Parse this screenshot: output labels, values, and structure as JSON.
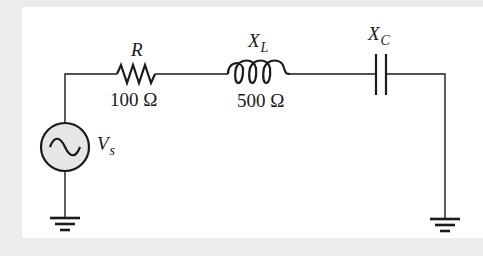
{
  "diagram": {
    "type": "series RLC circuit",
    "components": {
      "resistor": {
        "symbol": "R",
        "value": "100 Ω"
      },
      "inductor": {
        "symbol": "X",
        "subscript": "L",
        "value": "500 Ω"
      },
      "capacitor": {
        "symbol": "X",
        "subscript": "C"
      },
      "source": {
        "symbol": "V",
        "subscript": "s"
      }
    },
    "colors": {
      "background": "#ececec",
      "panel": "#ffffff",
      "wire": "#1a1a1a",
      "source_fill": "#e6e6e6"
    }
  }
}
